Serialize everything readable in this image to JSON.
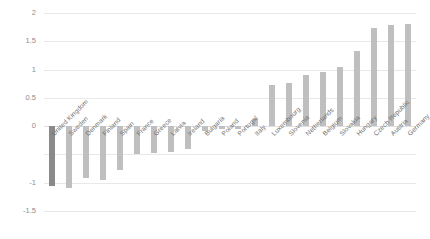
{
  "chart_data": {
    "type": "bar",
    "title": "",
    "subtitle": "",
    "xlabel": "",
    "ylabel": "",
    "ylim": [
      -1.5,
      2
    ],
    "yticks": [
      2,
      1.5,
      1,
      0.5,
      0,
      -0.5,
      -1,
      -1.5
    ],
    "ytick_labels": [
      "2",
      "1.5",
      "1",
      "0.5",
      "0",
      "-0.5",
      "-1",
      "-1.5"
    ],
    "grid": true,
    "legend": "none",
    "categories": [
      "United Kingdom",
      "Sweden",
      "Denmark",
      "Finland",
      "Spain",
      "France",
      "Greece",
      "Latvia",
      "Ireland",
      "Bulgaria",
      "Poland",
      "Portugal",
      "Italy",
      "Luxembourg",
      "Slovenia",
      "Netherlands",
      "Belgium",
      "Slovakia",
      "Hungary",
      "Czech Republic",
      "Austria",
      "Germany"
    ],
    "values": [
      -1.05,
      -1.1,
      -0.92,
      -0.95,
      -0.78,
      -0.5,
      -0.48,
      -0.45,
      -0.4,
      -0.08,
      -0.05,
      -0.05,
      0.12,
      0.73,
      0.76,
      0.9,
      0.95,
      1.05,
      1.32,
      1.73,
      1.78,
      1.8
    ],
    "colors": {
      "bar": "#bfbfbf",
      "bar_highlight": "#8a8a8a",
      "grid": "#e8e8e8",
      "axis_text": "#8c8c8c",
      "category_text": "#6e6e6e",
      "background": "#ffffff"
    },
    "highlight_categories": [
      "United Kingdom"
    ]
  }
}
